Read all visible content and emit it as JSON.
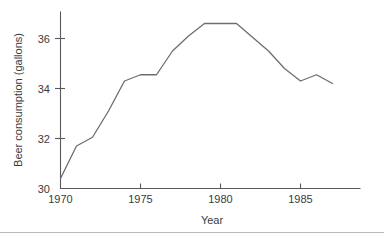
{
  "figure": {
    "background_color": "#ffffff",
    "line_color": "#6d6e70",
    "axis_color": "#58595b",
    "text_color": "#3b3b3b",
    "divider_color": "#b9b9b9"
  },
  "chart_data": {
    "type": "line",
    "title": "",
    "xlabel": "Year",
    "ylabel": "Beer consumption (gallons)",
    "xlim": [
      1970,
      1987.3
    ],
    "ylim": [
      30,
      37.0
    ],
    "grid": false,
    "legend": null,
    "xticks": [
      1970,
      1975,
      1980,
      1985
    ],
    "xtick_labels": [
      "1970",
      "1975",
      "1980",
      "1985"
    ],
    "yticks": [
      30,
      32,
      34,
      36
    ],
    "ytick_labels": [
      "30",
      "32",
      "34",
      "36"
    ],
    "series": [
      {
        "name": "Beer consumption (gallons)",
        "x": [
          1970,
          1971,
          1972,
          1973,
          1974,
          1975,
          1976,
          1977,
          1978,
          1979,
          1980,
          1981,
          1982,
          1983,
          1984,
          1985,
          1986,
          1987
        ],
        "values": [
          30.4,
          31.7,
          32.05,
          33.1,
          34.3,
          34.55,
          34.55,
          35.5,
          36.1,
          36.6,
          36.6,
          36.6,
          36.05,
          35.5,
          34.8,
          34.3,
          34.55,
          34.2
        ]
      }
    ]
  },
  "axis_labels": {
    "x_title": "Year",
    "y_title": "Beer consumption (gallons)"
  }
}
